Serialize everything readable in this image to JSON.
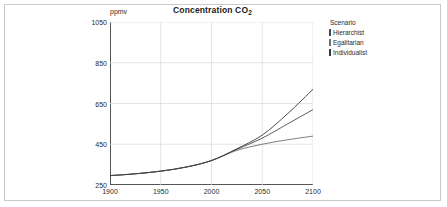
{
  "frame": {
    "border_color": "#c9c9c9"
  },
  "chart_data": {
    "type": "line",
    "title": "Concentration CO",
    "title_sub": "2",
    "ylabel": "ppmv",
    "xlabel": "",
    "xlim": [
      1900,
      2100
    ],
    "ylim": [
      250,
      1050
    ],
    "yticks": [
      250,
      450,
      650,
      850,
      1050
    ],
    "xticks": [
      1900,
      1950,
      2000,
      2050,
      2100
    ],
    "grid": true,
    "legend_position": "right",
    "legend_title": "Scenario",
    "x": [
      1900,
      1925,
      1950,
      1975,
      2000,
      2025,
      2050,
      2075,
      2100
    ],
    "series": [
      {
        "name": "Hierarchist",
        "color": "#4a4a4a",
        "values": [
          296,
          305,
          318,
          338,
          370,
          425,
          480,
          550,
          620
        ]
      },
      {
        "name": "Egalitarian",
        "color": "#6e6e6e",
        "values": [
          296,
          305,
          318,
          338,
          370,
          420,
          450,
          472,
          490
        ]
      },
      {
        "name": "Individualist",
        "color": "#3a3a3a",
        "values": [
          296,
          305,
          318,
          338,
          370,
          428,
          495,
          600,
          720
        ]
      }
    ]
  }
}
